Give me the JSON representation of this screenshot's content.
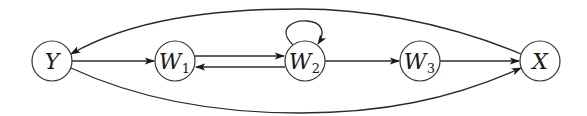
{
  "diagram": {
    "type": "directed-graph",
    "nodes": [
      {
        "id": "Y",
        "main": "Y",
        "sub": "",
        "cx": 52,
        "cy": 61
      },
      {
        "id": "W1",
        "main": "W",
        "sub": "1",
        "cx": 175,
        "cy": 61
      },
      {
        "id": "W2",
        "main": "W",
        "sub": "2",
        "cx": 305,
        "cy": 61
      },
      {
        "id": "W3",
        "main": "W",
        "sub": "3",
        "cx": 420,
        "cy": 61
      },
      {
        "id": "X",
        "main": "X",
        "sub": "",
        "cx": 540,
        "cy": 61
      }
    ],
    "edges": [
      {
        "from": "Y",
        "to": "W1",
        "shape": "straight"
      },
      {
        "from": "W1",
        "to": "W2",
        "shape": "straight-upper"
      },
      {
        "from": "W2",
        "to": "W1",
        "shape": "straight-lower"
      },
      {
        "from": "W2",
        "to": "W2",
        "shape": "self-loop"
      },
      {
        "from": "W2",
        "to": "W3",
        "shape": "straight"
      },
      {
        "from": "W3",
        "to": "X",
        "shape": "straight"
      },
      {
        "from": "X",
        "to": "Y",
        "shape": "arc-top"
      },
      {
        "from": "Y",
        "to": "X",
        "shape": "arc-bottom"
      }
    ],
    "colors": {
      "stroke": "#2a2a2a",
      "fill": "#ffffff"
    }
  }
}
